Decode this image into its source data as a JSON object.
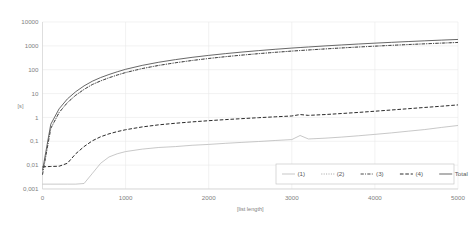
{
  "chart_data": {
    "type": "line",
    "title": "",
    "xlabel": "[list length]",
    "ylabel": "[s]",
    "yscale": "log",
    "xlim": [
      0,
      5000
    ],
    "ylim": [
      0.001,
      10000
    ],
    "grid": true,
    "legend_position": "bottom-right",
    "x_ticks": [
      "0",
      "1000",
      "2000",
      "3000",
      "4000",
      "5000"
    ],
    "x_tick_values": [
      0,
      1000,
      2000,
      3000,
      4000,
      5000
    ],
    "y_ticks": [
      "10000",
      "1000",
      "100",
      "10",
      "1",
      "0,1",
      "0,01",
      "0,001"
    ],
    "y_tick_values": [
      10000,
      1000,
      100,
      10,
      1,
      0.1,
      0.01,
      0.001
    ],
    "x": [
      0,
      100,
      200,
      300,
      400,
      500,
      600,
      700,
      800,
      900,
      1000,
      1200,
      1400,
      1600,
      1800,
      2000,
      2200,
      2400,
      2600,
      2800,
      3000,
      3100,
      3200,
      3400,
      3600,
      3800,
      4000,
      4200,
      4400,
      4600,
      4800,
      5000
    ],
    "series": [
      {
        "name": "(1)",
        "style": "solid",
        "color": "#b0b0b0",
        "width": 0.7,
        "values": [
          0.0016,
          0.0016,
          0.0016,
          0.0016,
          0.0016,
          0.0017,
          0.0045,
          0.012,
          0.022,
          0.03,
          0.037,
          0.047,
          0.055,
          0.06,
          0.068,
          0.074,
          0.082,
          0.09,
          0.098,
          0.108,
          0.118,
          0.175,
          0.125,
          0.135,
          0.15,
          0.17,
          0.195,
          0.225,
          0.265,
          0.31,
          0.38,
          0.46
        ]
      },
      {
        "name": "(2)",
        "style": "dotted",
        "color": "#8c8c8c",
        "width": 0.8,
        "values": [
          0.004,
          0.35,
          1.6,
          4.2,
          8.5,
          15,
          24,
          34,
          46,
          60,
          76,
          112,
          152,
          196,
          244,
          296,
          352,
          410,
          472,
          536,
          604,
          638,
          672,
          744,
          818,
          894,
          972,
          1052,
          1134,
          1218,
          1304,
          1390
        ]
      },
      {
        "name": "(3)",
        "style": "dashdot",
        "color": "#333333",
        "width": 0.9,
        "values": [
          0.004,
          0.35,
          1.6,
          4.2,
          8.5,
          15,
          24,
          34,
          46,
          60,
          76,
          112,
          152,
          196,
          244,
          296,
          352,
          410,
          472,
          536,
          604,
          638,
          672,
          744,
          818,
          894,
          972,
          1052,
          1134,
          1218,
          1304,
          1390
        ]
      },
      {
        "name": "(4)",
        "style": "dashed",
        "color": "#2b2b2b",
        "width": 1.0,
        "values": [
          0.0085,
          0.0088,
          0.009,
          0.012,
          0.03,
          0.06,
          0.105,
          0.155,
          0.205,
          0.255,
          0.305,
          0.4,
          0.49,
          0.57,
          0.65,
          0.73,
          0.81,
          0.89,
          0.975,
          1.06,
          1.15,
          1.32,
          1.22,
          1.32,
          1.46,
          1.62,
          1.82,
          2.05,
          2.32,
          2.62,
          2.95,
          3.35
        ]
      },
      {
        "name": "Total",
        "style": "solid",
        "color": "#4d4d4d",
        "width": 0.85,
        "values": [
          0.006,
          0.52,
          2.3,
          6.0,
          12.0,
          21,
          33,
          47,
          63,
          82,
          104,
          152,
          206,
          265,
          330,
          398,
          472,
          550,
          632,
          718,
          808,
          852,
          898,
          994,
          1092,
          1194,
          1298,
          1404,
          1514,
          1626,
          1740,
          1856
        ]
      }
    ]
  }
}
